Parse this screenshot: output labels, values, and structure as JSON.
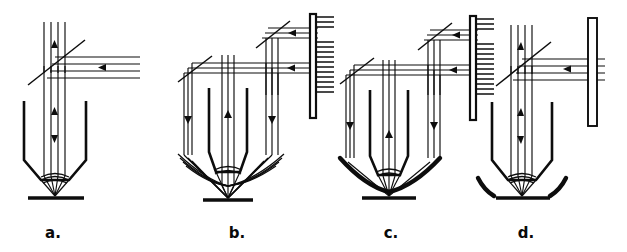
{
  "figure": {
    "background_color": "#ffffff",
    "ink_color": "#0d0d0d",
    "width": 627,
    "height": 252,
    "panel_count": 4
  },
  "panels": [
    {
      "id": "a",
      "label": "a.",
      "label_x": 53,
      "label_y": 238,
      "center_x": 75,
      "description": "Beamsplitter with transmitted horizontal beam, objective barrel focusing to sample plane",
      "beamsplitter": true,
      "beamsplitter_angle_deg": 45,
      "illumination_arms": 1,
      "bottom_optic": "none",
      "right_element": "none",
      "up_arrow_count": 2,
      "down_arrow_count": 1,
      "horizontal_arrow_count": 1
    },
    {
      "id": "b",
      "label": "b.",
      "label_x": 237,
      "label_y": 238,
      "center_x": 238,
      "description": "Two-level beamsplitter stack feeding outer annular beams, thin annular mirror below objective",
      "beamsplitter": true,
      "beamsplitter_angle_deg": 45,
      "illumination_arms": 3,
      "bottom_optic": "thin-annular-mirror",
      "right_element": "hatched-grating",
      "up_arrow_count": 1,
      "down_arrow_count": 2,
      "horizontal_arrow_count": 2
    },
    {
      "id": "c",
      "label": "c.",
      "label_x": 391,
      "label_y": 238,
      "center_x": 395,
      "description": "Two-level beamsplitter stack feeding outer annular beams, thick solid curved mirror below objective",
      "beamsplitter": true,
      "beamsplitter_angle_deg": 45,
      "illumination_arms": 3,
      "bottom_optic": "thick-curved-mirror",
      "right_element": "hatched-grating",
      "up_arrow_count": 1,
      "down_arrow_count": 2,
      "horizontal_arrow_count": 2
    },
    {
      "id": "d",
      "label": "d.",
      "label_x": 526,
      "label_y": 238,
      "center_x": 530,
      "description": "Beamsplitter with transmitted horizontal beam through hollow window bar, detached side arcs at sample",
      "beamsplitter": true,
      "beamsplitter_angle_deg": 45,
      "illumination_arms": 1,
      "bottom_optic": "detached-side-arcs",
      "right_element": "hollow-window-bar",
      "up_arrow_count": 2,
      "down_arrow_count": 1,
      "horizontal_arrow_count": 1
    }
  ],
  "legend": {
    "ray_label": "light ray",
    "objective_label": "objective barrel",
    "sample_plane_label": "sample plane",
    "beamsplitter_label": "beamsplitter",
    "grating_label": "hatched grating",
    "mirror_label": "curved mirror"
  }
}
